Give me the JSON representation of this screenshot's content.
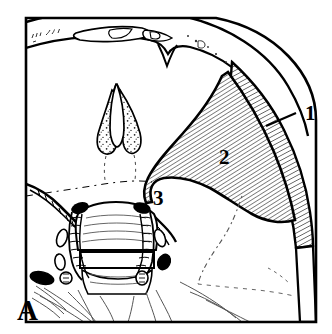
{
  "figure": {
    "panel_label": "A",
    "type": "anatomical-line-drawing",
    "background_color": "#ffffff",
    "ink_color": "#000000",
    "faint_ink_color": "#555555"
  },
  "callouts": [
    {
      "id": "callout-1",
      "label": "1",
      "has_leader_line": true,
      "label_x": 305,
      "label_y": 120,
      "leader_from_x": 296,
      "leader_from_y": 113,
      "leader_to_x": 266,
      "leader_to_y": 126,
      "target": "outer-hatched-band"
    },
    {
      "id": "callout-2",
      "label": "2",
      "has_leader_line": false,
      "label_x": 219,
      "label_y": 164,
      "target": "inner-hatched-wedge"
    },
    {
      "id": "callout-3",
      "label": "3",
      "has_leader_line": false,
      "label_x": 153,
      "label_y": 205,
      "target": "hatched-wedge-apex"
    }
  ],
  "panel": {
    "label": "A",
    "label_x": 17,
    "label_y": 320
  },
  "regions": {
    "outer_band_label": "1",
    "inner_wedge_label": "2",
    "apex_label": "3",
    "arch_band_name": "superior-arch-band",
    "spinous_process_name": "spinous-process",
    "vertebral_body_name": "vertebral-body",
    "dashed_line_name": "faint-dashed-boundary",
    "dotted_line_name": "faint-dotted-boundary"
  },
  "hatching": {
    "angle_deg": 62,
    "spacing_px": 4,
    "stroke_width": 1.05,
    "color": "#000000"
  }
}
